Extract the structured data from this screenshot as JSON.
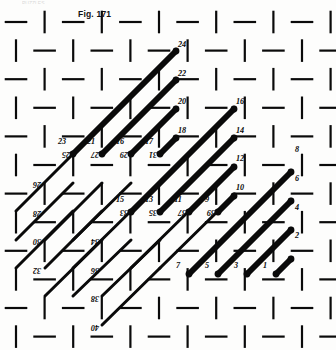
{
  "figure": {
    "caption": "Fig. 171",
    "trimmed_header_text": "PUZZLES",
    "type": "lattice-diagram",
    "background": "#fdfdfc",
    "ink": "#0a0a0a"
  },
  "diagram_data": {
    "type": "diagram",
    "description": "Staggered brick-like lattice grid with thick and thin diagonal chords connecting numbered nodes",
    "grid": {
      "origin_x": 16,
      "origin_y": 22,
      "cell": 28.6,
      "cols": 11,
      "rows": 11,
      "stroke_thin": 2.2,
      "segment_gap": 6
    },
    "labels_upright": [
      {
        "text": "24",
        "x": 182,
        "y": 47
      },
      {
        "text": "22",
        "x": 182,
        "y": 76
      },
      {
        "text": "20",
        "x": 182,
        "y": 104
      },
      {
        "text": "18",
        "x": 182,
        "y": 133
      },
      {
        "text": "16",
        "x": 240,
        "y": 104
      },
      {
        "text": "14",
        "x": 240,
        "y": 133
      },
      {
        "text": "12",
        "x": 240,
        "y": 161
      },
      {
        "text": "10",
        "x": 240,
        "y": 190
      },
      {
        "text": "8",
        "x": 297,
        "y": 152
      },
      {
        "text": "6",
        "x": 297,
        "y": 181
      },
      {
        "text": "4",
        "x": 297,
        "y": 210
      },
      {
        "text": "2",
        "x": 297,
        "y": 238
      },
      {
        "text": "23",
        "x": 62,
        "y": 144
      },
      {
        "text": "21",
        "x": 91,
        "y": 144
      },
      {
        "text": "16",
        "x": 120,
        "y": 144
      },
      {
        "text": "17",
        "x": 149,
        "y": 144
      },
      {
        "text": "15",
        "x": 120,
        "y": 202
      },
      {
        "text": "13",
        "x": 149,
        "y": 202
      },
      {
        "text": "11",
        "x": 178,
        "y": 202
      },
      {
        "text": "9",
        "x": 207,
        "y": 202
      },
      {
        "text": "7",
        "x": 178,
        "y": 268
      },
      {
        "text": "5",
        "x": 207,
        "y": 268
      },
      {
        "text": "3",
        "x": 236,
        "y": 268
      },
      {
        "text": "1",
        "x": 265,
        "y": 268
      }
    ],
    "labels_inverted": [
      {
        "text": "25",
        "x": 66,
        "y": 158
      },
      {
        "text": "27",
        "x": 95,
        "y": 158
      },
      {
        "text": "29",
        "x": 124,
        "y": 158
      },
      {
        "text": "31",
        "x": 153,
        "y": 158
      },
      {
        "text": "26",
        "x": 37,
        "y": 188
      },
      {
        "text": "28",
        "x": 37,
        "y": 217
      },
      {
        "text": "30",
        "x": 37,
        "y": 245
      },
      {
        "text": "32",
        "x": 37,
        "y": 274
      },
      {
        "text": "33",
        "x": 124,
        "y": 216
      },
      {
        "text": "35",
        "x": 153,
        "y": 216
      },
      {
        "text": "37",
        "x": 182,
        "y": 216
      },
      {
        "text": "39",
        "x": 211,
        "y": 216
      },
      {
        "text": "34",
        "x": 95,
        "y": 245
      },
      {
        "text": "36",
        "x": 95,
        "y": 274
      },
      {
        "text": "38",
        "x": 95,
        "y": 302
      },
      {
        "text": "40",
        "x": 95,
        "y": 331
      }
    ],
    "chords_thick": [
      {
        "x1": 73,
        "y1": 154,
        "x2": 176,
        "y2": 51,
        "w": 6
      },
      {
        "x1": 102,
        "y1": 154,
        "x2": 176,
        "y2": 80,
        "w": 6
      },
      {
        "x1": 131,
        "y1": 154,
        "x2": 176,
        "y2": 109,
        "w": 6
      },
      {
        "x1": 160,
        "y1": 154,
        "x2": 176,
        "y2": 138,
        "w": 6
      },
      {
        "x1": 160,
        "y1": 212,
        "x2": 234,
        "y2": 138,
        "w": 6
      },
      {
        "x1": 189,
        "y1": 212,
        "x2": 234,
        "y2": 167,
        "w": 6
      },
      {
        "x1": 218,
        "y1": 212,
        "x2": 234,
        "y2": 196,
        "w": 6
      },
      {
        "x1": 131,
        "y1": 212,
        "x2": 234,
        "y2": 109,
        "w": 6
      },
      {
        "x1": 218,
        "y1": 274,
        "x2": 291,
        "y2": 201,
        "w": 6
      },
      {
        "x1": 247,
        "y1": 274,
        "x2": 291,
        "y2": 230,
        "w": 6
      },
      {
        "x1": 276,
        "y1": 274,
        "x2": 291,
        "y2": 259,
        "w": 6
      },
      {
        "x1": 189,
        "y1": 274,
        "x2": 291,
        "y2": 172,
        "w": 6
      }
    ],
    "chords_thin": [
      {
        "x1": 16,
        "y1": 268,
        "x2": 73,
        "y2": 211,
        "w": 3
      },
      {
        "x1": 16,
        "y1": 240,
        "x2": 73,
        "y2": 183,
        "w": 3
      },
      {
        "x1": 16,
        "y1": 211,
        "x2": 73,
        "y2": 154,
        "w": 3
      },
      {
        "x1": 45,
        "y1": 268,
        "x2": 102,
        "y2": 211,
        "w": 3
      },
      {
        "x1": 45,
        "y1": 240,
        "x2": 102,
        "y2": 183,
        "w": 3
      },
      {
        "x1": 45,
        "y1": 296,
        "x2": 102,
        "y2": 240,
        "w": 3
      },
      {
        "x1": 73,
        "y1": 296,
        "x2": 131,
        "y2": 240,
        "w": 3
      },
      {
        "x1": 73,
        "y1": 268,
        "x2": 131,
        "y2": 211,
        "w": 3
      },
      {
        "x1": 73,
        "y1": 240,
        "x2": 131,
        "y2": 183,
        "w": 3
      },
      {
        "x1": 102,
        "y1": 325,
        "x2": 160,
        "y2": 268,
        "w": 3
      },
      {
        "x1": 102,
        "y1": 296,
        "x2": 160,
        "y2": 240,
        "w": 3
      },
      {
        "x1": 131,
        "y1": 268,
        "x2": 189,
        "y2": 211,
        "w": 3
      },
      {
        "x1": 160,
        "y1": 268,
        "x2": 218,
        "y2": 211,
        "w": 3
      },
      {
        "x1": 102,
        "y1": 154,
        "x2": 131,
        "y2": 125,
        "w": 3
      }
    ],
    "nodes": [
      {
        "x": 176,
        "y": 51
      },
      {
        "x": 176,
        "y": 80
      },
      {
        "x": 176,
        "y": 109
      },
      {
        "x": 176,
        "y": 138
      },
      {
        "x": 234,
        "y": 109
      },
      {
        "x": 234,
        "y": 138
      },
      {
        "x": 234,
        "y": 167
      },
      {
        "x": 234,
        "y": 196
      },
      {
        "x": 291,
        "y": 172
      },
      {
        "x": 291,
        "y": 201
      },
      {
        "x": 291,
        "y": 230
      },
      {
        "x": 291,
        "y": 259
      },
      {
        "x": 73,
        "y": 154
      },
      {
        "x": 102,
        "y": 154
      },
      {
        "x": 131,
        "y": 154
      },
      {
        "x": 160,
        "y": 154
      },
      {
        "x": 131,
        "y": 212
      },
      {
        "x": 160,
        "y": 212
      },
      {
        "x": 189,
        "y": 212
      },
      {
        "x": 218,
        "y": 212
      },
      {
        "x": 189,
        "y": 274
      },
      {
        "x": 218,
        "y": 274
      },
      {
        "x": 247,
        "y": 274
      },
      {
        "x": 276,
        "y": 274
      }
    ]
  }
}
